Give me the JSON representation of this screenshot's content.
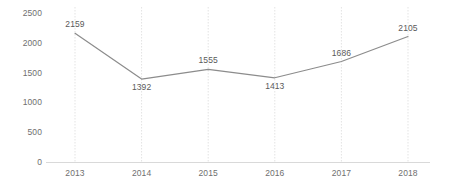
{
  "chart_data": {
    "type": "line",
    "title": "",
    "subtitle": "",
    "xlabel": "",
    "ylabel": "",
    "categories": [
      "2013",
      "2014",
      "2015",
      "2016",
      "2017",
      "2018"
    ],
    "values": [
      2159,
      1392,
      1555,
      1413,
      1686,
      2105
    ],
    "series": [
      {
        "name": "",
        "values": [
          2159,
          1392,
          1555,
          1413,
          1686,
          2105
        ]
      }
    ],
    "point_labels": [
      "2159",
      "1392",
      "1555",
      "1413",
      "1686",
      "2105"
    ],
    "point_label_position": [
      "above",
      "below",
      "above",
      "below",
      "above",
      "above"
    ],
    "ylim": [
      0,
      2500
    ],
    "y_ticks": [
      0,
      500,
      1000,
      1500,
      2000,
      2500
    ],
    "y_tick_labels": [
      "0",
      "500",
      "1000",
      "1500",
      "2000",
      "2500"
    ],
    "x_tick_labels": [
      "2013",
      "2014",
      "2015",
      "2016",
      "2017",
      "2018"
    ],
    "grid": {
      "vertical": true,
      "horizontal": false,
      "style": "dotted"
    },
    "legend": {
      "visible": false,
      "position": "none",
      "entries": []
    },
    "markers": false,
    "colors": {
      "line": "#8c8c8c",
      "gridline": "#e3e3e3",
      "axis": "#d9d9d9",
      "tick_text": "#6f6f6f",
      "label_text": "#5a5a5a",
      "background": "#ffffff"
    }
  }
}
